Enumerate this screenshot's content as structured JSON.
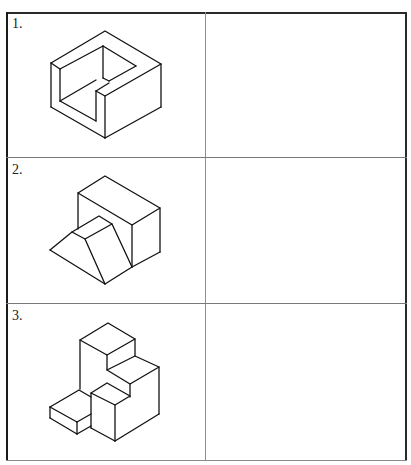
{
  "worksheet": {
    "rows": [
      {
        "label": "1.",
        "figure": "isometric-u-block-with-notch",
        "answer": ""
      },
      {
        "label": "2.",
        "figure": "isometric-block-with-ramp",
        "answer": ""
      },
      {
        "label": "3.",
        "figure": "isometric-stepped-block",
        "answer": ""
      }
    ]
  },
  "colors": {
    "background": "#ffffff",
    "lines": "#111111",
    "grid": "#8a8a8a"
  }
}
